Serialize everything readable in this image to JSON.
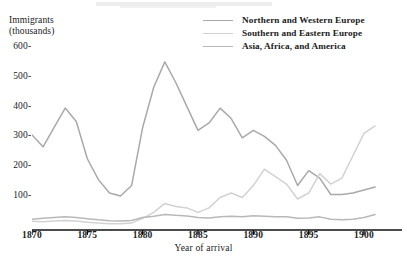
{
  "figure": {
    "y_axis_title": "Immigrants\n(thousands)",
    "x_axis_title": "Year of arrival"
  },
  "legend": {
    "items": [
      {
        "label": "Northern and Western Europe",
        "color": "#a9a9a9"
      },
      {
        "label": "Southern and Eastern Europe",
        "color": "#d2d2d2"
      },
      {
        "label": "Asia, Africa, and America",
        "color": "#b8b8b8"
      }
    ]
  },
  "axis": {
    "y_ticks": [
      "600",
      "500",
      "400",
      "300",
      "200",
      "100"
    ],
    "y_tick_values": [
      600,
      500,
      400,
      300,
      200,
      100
    ],
    "x_ticks": [
      "1870",
      "1875",
      "1880",
      "1885",
      "1890",
      "1895",
      "1900"
    ],
    "x_tick_values": [
      1870,
      1875,
      1880,
      1885,
      1890,
      1895,
      1900
    ],
    "tick_dash": "-"
  },
  "chart_data": {
    "type": "line",
    "title": "",
    "xlabel": "Year of arrival",
    "ylabel": "Immigrants (thousands)",
    "xlim": [
      1870,
      1901
    ],
    "ylim": [
      0,
      640
    ],
    "grid": false,
    "legend_position": "top-right",
    "x": [
      1870,
      1871,
      1872,
      1873,
      1874,
      1875,
      1876,
      1877,
      1878,
      1879,
      1880,
      1881,
      1882,
      1883,
      1884,
      1885,
      1886,
      1887,
      1888,
      1889,
      1890,
      1891,
      1892,
      1893,
      1894,
      1895,
      1896,
      1897,
      1898,
      1899,
      1900,
      1901
    ],
    "series": [
      {
        "name": "Northern and Western Europe",
        "color": "#a9a9a9",
        "values": [
          305,
          265,
          330,
          395,
          350,
          225,
          155,
          110,
          100,
          135,
          330,
          465,
          550,
          480,
          400,
          320,
          345,
          395,
          360,
          295,
          320,
          300,
          270,
          220,
          135,
          185,
          160,
          105,
          105,
          110,
          120,
          130
        ]
      },
      {
        "name": "Southern and Eastern Europe",
        "color": "#d2d2d2",
        "values": [
          15,
          14,
          16,
          18,
          16,
          12,
          9,
          7,
          7,
          9,
          25,
          45,
          75,
          65,
          60,
          45,
          60,
          95,
          110,
          95,
          135,
          190,
          165,
          140,
          90,
          110,
          175,
          140,
          160,
          235,
          310,
          335
        ]
      },
      {
        "name": "Asia, Africa, and America",
        "color": "#b8b8b8",
        "values": [
          22,
          25,
          28,
          30,
          28,
          24,
          20,
          17,
          16,
          18,
          28,
          32,
          38,
          35,
          33,
          28,
          26,
          30,
          32,
          30,
          34,
          32,
          30,
          30,
          25,
          26,
          30,
          22,
          20,
          22,
          28,
          38
        ]
      }
    ]
  }
}
